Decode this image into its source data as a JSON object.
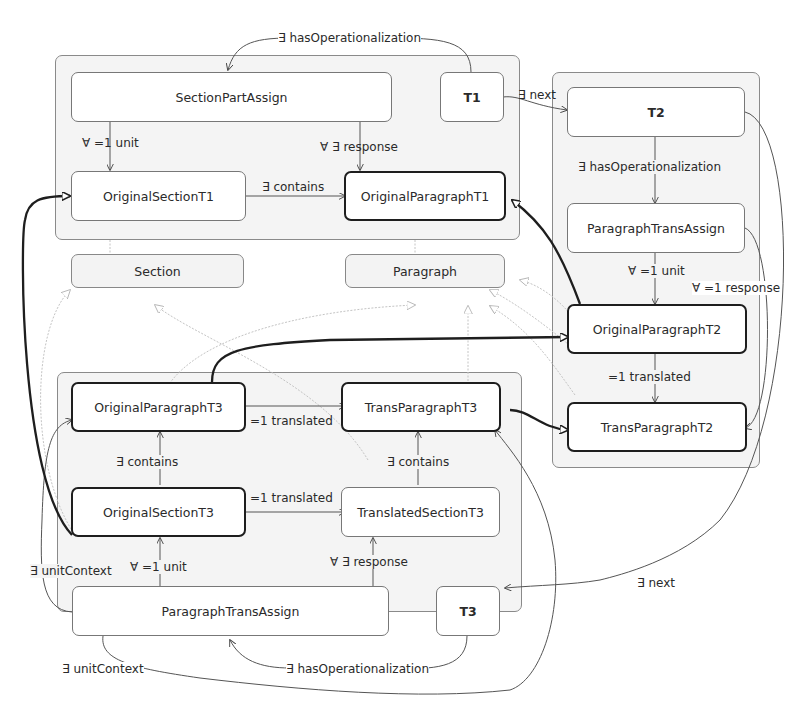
{
  "diagram": {
    "containers": [
      {
        "id": "T1-group",
        "x": 55,
        "y": 55,
        "w": 465,
        "h": 185
      },
      {
        "id": "T2-group",
        "x": 552,
        "y": 72,
        "w": 208,
        "h": 396
      },
      {
        "id": "T3-group",
        "x": 57,
        "y": 372,
        "w": 465,
        "h": 240
      }
    ],
    "nodes": {
      "section_part_assign": "SectionPartAssign",
      "t1": "T1",
      "original_section_t1": "OriginalSectionT1",
      "original_paragraph_t1": "OriginalParagraphT1",
      "section": "Section",
      "paragraph": "Paragraph",
      "t2": "T2",
      "paragraph_trans_assign_t2": "ParagraphTransAssign",
      "original_paragraph_t2": "OriginalParagraphT2",
      "trans_paragraph_t2": "TransParagraphT2",
      "original_paragraph_t3": "OriginalParagraphT3",
      "trans_paragraph_t3": "TransParagraphT3",
      "original_section_t3": "OriginalSectionT3",
      "translated_section_t3": "TranslatedSectionT3",
      "paragraph_trans_assign_t3": "ParagraphTransAssign",
      "t3": "T3"
    },
    "edge_labels": {
      "t1_has_op": "∃ hasOperationalization",
      "t1_next": "∃ next",
      "spa_unit": "∀ =1 unit",
      "spa_response": "∀ ∃ response",
      "ost1_contains": "∃ contains",
      "t2_has_op": "∃ hasOperationalization",
      "pta2_unit": "∀ =1 unit",
      "pta2_response": "∀ =1 response",
      "opt2_translated": "=1 translated",
      "opt3_translated": "=1 translated",
      "ost3_contains": "∃ contains",
      "tst3_contains": "∃ contains",
      "ost3_translated": "=1 translated",
      "pta3_unit": "∀ =1 unit",
      "pta3_response": "∀ ∃ response",
      "pta3_unit_context_left": "∃ unitContext",
      "pta3_unit_context_bottom": "∃ unitContext",
      "t3_has_op": "∃ hasOperationalization",
      "t2_next": "∃ next"
    },
    "colors": {
      "thick_edge": "#1e1e1e",
      "thin_edge": "#555555",
      "faint_edge": "#bdbdbd",
      "container_fill": "#f4f4f4"
    }
  }
}
